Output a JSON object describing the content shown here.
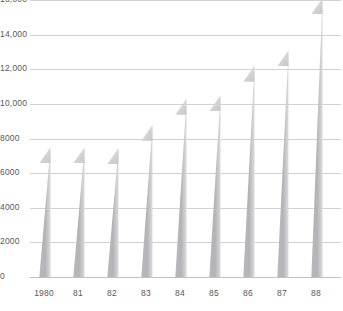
{
  "chart_data": {
    "type": "bar",
    "title": "",
    "subtitle": "",
    "xlabel": "",
    "ylabel": "",
    "categories": [
      "1980",
      "81",
      "82",
      "83",
      "84",
      "85",
      "86",
      "87",
      "88"
    ],
    "values": [
      7500,
      7500,
      7450,
      8800,
      10300,
      10500,
      12200,
      13100,
      16100
    ],
    "series": [
      {
        "name": "",
        "values": [
          7500,
          7500,
          7450,
          8800,
          10300,
          10500,
          12200,
          13100,
          16100
        ]
      }
    ],
    "ylim": [
      0,
      16000
    ],
    "ytick_values": [
      0,
      2000,
      4000,
      6000,
      8000,
      10000,
      12000,
      14000,
      16000
    ],
    "ytick_labels": [
      "0",
      "2000",
      "4000",
      "6000",
      "8000",
      "10,000",
      "12,000",
      "14,000",
      "16,000"
    ],
    "grid": true,
    "grid_axis": "y",
    "legend": false,
    "legend_position": "none",
    "annotations": []
  },
  "style": {
    "bar_color": "#b4b4b6",
    "bar_highlight_color": "#dedee0",
    "bar_top_facet_color": "#d8d8da",
    "grid_color": "#d2d2d4",
    "axis_color": "#c2c2c4",
    "label_color": "#58585a",
    "background_color": "#ffffff"
  },
  "geometry": {
    "plot_left": 30,
    "plot_top": 0,
    "plot_width": 311,
    "plot_height": 277,
    "baseline_y": 277,
    "bar_pitch": 34,
    "bar_width": 13,
    "bar_first_center": 44,
    "slant_height": 16
  }
}
